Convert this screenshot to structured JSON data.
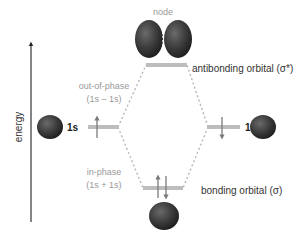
{
  "diagram": {
    "axis": {
      "label": "energy"
    },
    "atomic_orbitals": {
      "left": {
        "label": "1s",
        "electron": "up"
      },
      "right": {
        "label": "1s",
        "electron": "down"
      }
    },
    "molecular_orbitals": {
      "antibonding": {
        "label": "antibonding orbital (σ*)",
        "combination_title": "out-of-phase",
        "combination_formula": "(1s – 1s)",
        "node_label": "node",
        "electrons": 0
      },
      "bonding": {
        "label": "bonding orbital (σ)",
        "combination_title": "in-phase",
        "combination_formula": "(1s + 1s)",
        "electrons": 2
      }
    },
    "colors": {
      "sphere": "#3a3a3a",
      "level_bar": "#bdbdbd",
      "arrow": "#7a7a7a",
      "dashed": "#b8b8b8",
      "muted_text": "#9a9a9a",
      "text": "#333333",
      "axis": "#333333"
    }
  }
}
